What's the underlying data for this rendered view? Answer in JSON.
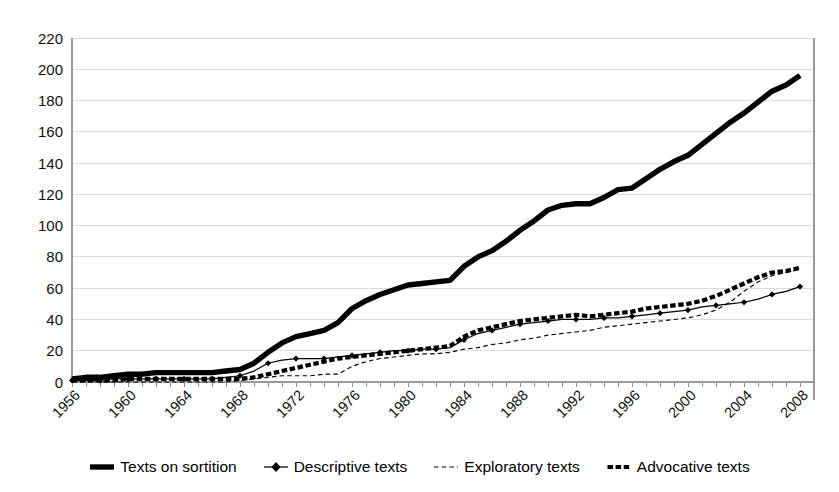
{
  "chart_data": {
    "type": "line",
    "title": "",
    "xlabel": "",
    "ylabel": "",
    "xlim": [
      1956,
      2009
    ],
    "ylim": [
      0,
      220
    ],
    "ytick_step": 20,
    "grid": true,
    "legend_position": "bottom",
    "yticks": [
      0,
      20,
      40,
      60,
      80,
      100,
      120,
      140,
      160,
      180,
      200,
      220
    ],
    "xticks": [
      1956,
      1960,
      1964,
      1968,
      1972,
      1976,
      1980,
      1984,
      1988,
      1992,
      1996,
      2000,
      2004,
      2008
    ],
    "x": [
      1956,
      1957,
      1958,
      1959,
      1960,
      1961,
      1962,
      1963,
      1964,
      1965,
      1966,
      1967,
      1968,
      1969,
      1970,
      1971,
      1972,
      1973,
      1974,
      1975,
      1976,
      1977,
      1978,
      1979,
      1980,
      1981,
      1982,
      1983,
      1984,
      1985,
      1986,
      1987,
      1988,
      1989,
      1990,
      1991,
      1992,
      1993,
      1994,
      1995,
      1996,
      1997,
      1998,
      1999,
      2000,
      2001,
      2002,
      2003,
      2004,
      2005,
      2006,
      2007,
      2008
    ],
    "series": [
      {
        "name": "Texts on sortition",
        "style": "thick-solid",
        "marker": "none",
        "color": "#000000",
        "values": [
          2,
          3,
          3,
          4,
          5,
          5,
          6,
          6,
          6,
          6,
          6,
          7,
          8,
          12,
          19,
          25,
          29,
          31,
          33,
          38,
          47,
          52,
          56,
          59,
          62,
          63,
          64,
          65,
          74,
          80,
          84,
          90,
          97,
          103,
          110,
          113,
          114,
          114,
          118,
          123,
          124,
          130,
          136,
          141,
          145,
          152,
          159,
          166,
          172,
          179,
          186,
          190,
          196
        ]
      },
      {
        "name": "Descriptive texts",
        "style": "thin-solid",
        "marker": "diamond",
        "color": "#000000",
        "values": [
          1,
          1,
          1,
          2,
          2,
          2,
          2,
          2,
          2,
          2,
          2,
          3,
          4,
          7,
          12,
          14,
          15,
          15,
          15,
          16,
          17,
          18,
          19,
          20,
          20,
          21,
          21,
          22,
          27,
          31,
          33,
          35,
          37,
          38,
          39,
          40,
          40,
          40,
          41,
          41,
          42,
          43,
          44,
          45,
          46,
          48,
          49,
          50,
          51,
          53,
          56,
          58,
          61
        ]
      },
      {
        "name": "Exploratory texts",
        "style": "thin-dashed",
        "marker": "none",
        "color": "#000000",
        "values": [
          0,
          0,
          0,
          0,
          0,
          0,
          0,
          0,
          0,
          0,
          0,
          0,
          1,
          2,
          3,
          4,
          4,
          4,
          5,
          5,
          10,
          13,
          15,
          16,
          17,
          18,
          18,
          19,
          21,
          22,
          24,
          25,
          27,
          28,
          30,
          31,
          32,
          33,
          35,
          36,
          37,
          38,
          39,
          40,
          41,
          43,
          46,
          51,
          58,
          64,
          68,
          70,
          72
        ]
      },
      {
        "name": "Advocative texts",
        "style": "thick-dotted",
        "marker": "none",
        "color": "#000000",
        "values": [
          1,
          1,
          1,
          1,
          2,
          2,
          2,
          2,
          2,
          2,
          2,
          2,
          2,
          3,
          5,
          7,
          9,
          11,
          13,
          15,
          16,
          17,
          18,
          19,
          20,
          21,
          22,
          23,
          29,
          33,
          35,
          37,
          39,
          40,
          41,
          42,
          43,
          42,
          43,
          44,
          45,
          47,
          48,
          49,
          50,
          52,
          55,
          59,
          63,
          67,
          70,
          71,
          73
        ]
      }
    ]
  },
  "legend": {
    "items": [
      {
        "label": "Texts on sortition",
        "swatch": "thick-solid-swatch"
      },
      {
        "label": "Descriptive texts",
        "swatch": "diamond-marker-swatch"
      },
      {
        "label": "Exploratory texts",
        "swatch": "thin-dashed-swatch"
      },
      {
        "label": "Advocative texts",
        "swatch": "thick-dotted-swatch"
      }
    ]
  }
}
